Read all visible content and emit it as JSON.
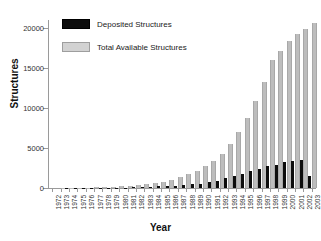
{
  "chart_data": {
    "type": "bar",
    "title": "",
    "xlabel": "Year",
    "ylabel": "Structures",
    "ylim": [
      0,
      21000
    ],
    "yticks": [
      0,
      5000,
      10000,
      15000,
      20000
    ],
    "ytick_labels": [
      "0",
      "5000",
      "10000",
      "15000",
      "20000"
    ],
    "grid": false,
    "legend_position": "top-left",
    "categories": [
      "1972",
      "1973",
      "1974",
      "1975",
      "1976",
      "1977",
      "1978",
      "1979",
      "1980",
      "1981",
      "1982",
      "1983",
      "1984",
      "1985",
      "1986",
      "1987",
      "1988",
      "1989",
      "1990",
      "1991",
      "1992",
      "1993",
      "1994",
      "1995",
      "1996",
      "1997",
      "1998",
      "1999",
      "2000",
      "2001",
      "2002",
      "2003"
    ],
    "series": [
      {
        "name": "Deposited Structures",
        "color": "#0d0d0d",
        "values": [
          5,
          8,
          12,
          15,
          20,
          25,
          30,
          35,
          40,
          60,
          80,
          110,
          150,
          200,
          250,
          300,
          350,
          450,
          550,
          700,
          900,
          1200,
          1500,
          1800,
          2100,
          2400,
          2700,
          2900,
          3200,
          3400,
          3500,
          1500
        ]
      },
      {
        "name": "Total Available Structures",
        "color": "#bdbdbd",
        "values": [
          5,
          13,
          25,
          40,
          60,
          85,
          115,
          150,
          190,
          250,
          330,
          440,
          590,
          790,
          1040,
          1340,
          1690,
          2140,
          2690,
          3390,
          4290,
          5490,
          6990,
          8790,
          10890,
          13290,
          15990,
          17100,
          18400,
          19300,
          19900,
          20600
        ]
      }
    ]
  },
  "legend": {
    "items": [
      {
        "label": "Deposited Structures"
      },
      {
        "label": "Total Available Structures"
      }
    ]
  }
}
